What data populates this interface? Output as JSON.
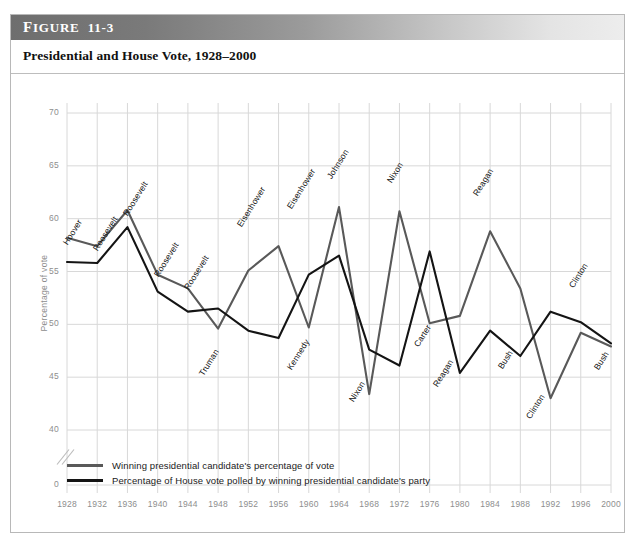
{
  "figure": {
    "label_small": "IGURE",
    "label_first": "F",
    "label_number": "11-3",
    "title": "Presidential and House Vote, 1928–2000"
  },
  "legend": {
    "items": [
      {
        "name": "presidential",
        "label": "Winning presidential candidate's percentage of vote",
        "color": "#595959"
      },
      {
        "name": "house",
        "label": "Percentage of House vote polled by winning presidential candidate's party",
        "color": "#141414"
      }
    ]
  },
  "axes": {
    "y_title": "Percentage of vote",
    "y_ticks": [
      "0",
      "40",
      "45",
      "50",
      "55",
      "60",
      "65",
      "70"
    ],
    "x_ticks": [
      "1928",
      "1932",
      "1936",
      "1940",
      "1944",
      "1948",
      "1952",
      "1956",
      "1960",
      "1964",
      "1968",
      "1972",
      "1976",
      "1980",
      "1984",
      "1988",
      "1992",
      "1996",
      "2000"
    ],
    "axis_break": true
  },
  "chart_data": {
    "type": "line",
    "title": "Presidential and House Vote, 1928–2000",
    "xlabel": "",
    "ylabel": "Percentage of vote",
    "ylim": [
      40,
      70
    ],
    "y_ticks": [
      40,
      45,
      50,
      55,
      60,
      65,
      70
    ],
    "zero_tick_shown": true,
    "axis_break_between": [
      0,
      40
    ],
    "grid": true,
    "legend_position": "below-plot-left",
    "x": [
      1928,
      1932,
      1936,
      1940,
      1944,
      1948,
      1952,
      1956,
      1960,
      1964,
      1968,
      1972,
      1976,
      1980,
      1984,
      1988,
      1992,
      1996,
      2000
    ],
    "series": [
      {
        "name": "Winning presidential candidate's percentage of vote",
        "color": "#595959",
        "values": [
          58.2,
          57.4,
          60.8,
          54.7,
          53.4,
          49.6,
          55.1,
          57.4,
          49.7,
          61.1,
          43.4,
          60.7,
          50.1,
          50.8,
          58.8,
          53.4,
          43.0,
          49.2,
          47.9
        ]
      },
      {
        "name": "Percentage of House vote polled by winning presidential candidate's party",
        "color": "#141414",
        "values": [
          55.9,
          55.8,
          59.2,
          53.1,
          51.2,
          51.5,
          49.4,
          48.7,
          54.7,
          56.5,
          47.6,
          46.1,
          56.9,
          45.4,
          49.4,
          47.0,
          51.2,
          50.2,
          48.2
        ]
      }
    ],
    "point_labels": [
      {
        "year": 1928,
        "series": "presidential",
        "text": "Hoover"
      },
      {
        "year": 1932,
        "series": "presidential",
        "text": "Roosevelt"
      },
      {
        "year": 1936,
        "series": "presidential",
        "text": "Roosevelt"
      },
      {
        "year": 1940,
        "series": "presidential",
        "text": "Roosevelt"
      },
      {
        "year": 1944,
        "series": "presidential",
        "text": "Roosevelt"
      },
      {
        "year": 1948,
        "series": "presidential",
        "text": "Truman"
      },
      {
        "year": 1952,
        "series": "presidential",
        "text": "Eisenhower"
      },
      {
        "year": 1956,
        "series": "presidential",
        "text": "Eisenhower"
      },
      {
        "year": 1960,
        "series": "presidential",
        "text": "Kennedy"
      },
      {
        "year": 1964,
        "series": "presidential",
        "text": "Johnson"
      },
      {
        "year": 1968,
        "series": "presidential",
        "text": "Nixon"
      },
      {
        "year": 1972,
        "series": "presidential",
        "text": "Nixon"
      },
      {
        "year": 1976,
        "series": "presidential",
        "text": "Carter"
      },
      {
        "year": 1980,
        "series": "presidential",
        "text": "Reagan"
      },
      {
        "year": 1984,
        "series": "presidential",
        "text": "Reagan"
      },
      {
        "year": 1988,
        "series": "presidential",
        "text": "Bush"
      },
      {
        "year": 1992,
        "series": "presidential",
        "text": "Clinton"
      },
      {
        "year": 1996,
        "series": "presidential",
        "text": "Clinton"
      },
      {
        "year": 2000,
        "series": "presidential",
        "text": "Bush"
      }
    ]
  },
  "layout": {
    "plot_left": 56,
    "plot_right": 600,
    "y_top_px": 40,
    "y_bottom_px": 357,
    "y_zero_px": 412,
    "label_positions": [
      {
        "text": "Hoover",
        "x": 54,
        "y": 166
      },
      {
        "text": "Roosevelt",
        "x": 84,
        "y": 172
      },
      {
        "text": "Roosevelt",
        "x": 114,
        "y": 137
      },
      {
        "text": "Roosevelt",
        "x": 145,
        "y": 198
      },
      {
        "text": "Roosevelt",
        "x": 175,
        "y": 211
      },
      {
        "text": "Truman",
        "x": 190,
        "y": 297
      },
      {
        "text": "Eisenhower",
        "x": 228,
        "y": 148
      },
      {
        "text": "Eisenhower",
        "x": 278,
        "y": 130
      },
      {
        "text": "Kennedy",
        "x": 278,
        "y": 291
      },
      {
        "text": "Johnson",
        "x": 318,
        "y": 100
      },
      {
        "text": "Nixon",
        "x": 340,
        "y": 323
      },
      {
        "text": "Nixon",
        "x": 378,
        "y": 104
      },
      {
        "text": "Carter",
        "x": 405,
        "y": 268
      },
      {
        "text": "Reagan",
        "x": 424,
        "y": 308
      },
      {
        "text": "Reagan",
        "x": 464,
        "y": 117
      },
      {
        "text": "Bush",
        "x": 489,
        "y": 290
      },
      {
        "text": "Clinton",
        "x": 517,
        "y": 340
      },
      {
        "text": "Clinton",
        "x": 560,
        "y": 209
      },
      {
        "text": "Bush",
        "x": 585,
        "y": 291
      }
    ]
  }
}
